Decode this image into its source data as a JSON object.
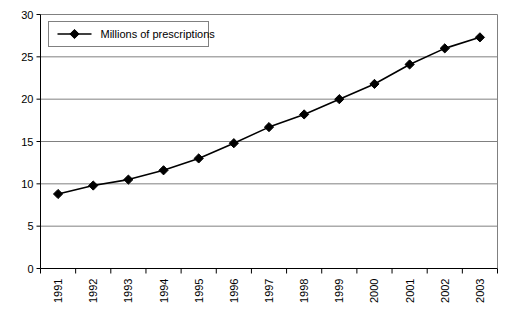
{
  "chart_data": {
    "type": "line",
    "title": "",
    "subtitle": "",
    "xlabel": "",
    "ylabel": "",
    "categories": [
      "1991",
      "1992",
      "1993",
      "1994",
      "1995",
      "1996",
      "1997",
      "1998",
      "1999",
      "2000",
      "2001",
      "2002",
      "2003"
    ],
    "series": [
      {
        "name": "Millions of prescriptions",
        "values": [
          8.8,
          9.8,
          10.5,
          11.6,
          13.0,
          14.8,
          16.7,
          18.2,
          20.0,
          21.8,
          24.1,
          26.0,
          27.3
        ],
        "marker": "diamond",
        "color": "#000000"
      }
    ],
    "ylim": [
      0,
      30
    ],
    "yticks": [
      0,
      5,
      10,
      15,
      20,
      25,
      30
    ],
    "ytick_labels": [
      "0",
      "5",
      "10",
      "15",
      "20",
      "25",
      "30"
    ],
    "grid": {
      "horizontal": true,
      "vertical": false,
      "color": "#808080"
    },
    "legend": {
      "entries": [
        "Millions of prescriptions"
      ],
      "position": "top-left",
      "border": true
    },
    "xtick_label_rotation": -90,
    "plot_border": true,
    "colors": {
      "line": "#000000",
      "marker": "#000000",
      "axis": "#000000",
      "grid": "#808080",
      "background": "#ffffff",
      "legend_border": "#808080"
    }
  },
  "legend": {
    "series_label": "Millions of prescriptions"
  }
}
